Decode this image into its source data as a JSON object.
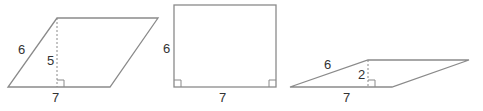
{
  "colors": {
    "stroke": "#8a8a8a",
    "text": "#333333",
    "background": "#ffffff"
  },
  "shapes": [
    {
      "type": "parallelogram",
      "side_label": "6",
      "height_label": "5",
      "base_label": "7",
      "points": "8,87 110,87 158,18 57,18",
      "height_line": {
        "x": 57,
        "y1": 18,
        "y2": 87
      }
    },
    {
      "type": "rectangle",
      "side_label": "6",
      "base_label": "7",
      "rect": {
        "x": 174,
        "y": 5,
        "w": 102,
        "h": 82
      }
    },
    {
      "type": "parallelogram",
      "side_label": "6",
      "height_label": "2",
      "base_label": "7",
      "points": "290,87 392,87 469,60 368,60",
      "height_line": {
        "x": 368,
        "y1": 60,
        "y2": 87
      }
    }
  ]
}
